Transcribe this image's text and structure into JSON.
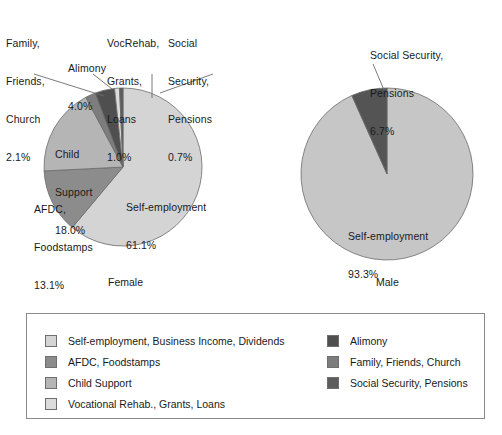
{
  "chart_data": {
    "type": "pie",
    "title": "",
    "charts": [
      {
        "name": "Female",
        "caption": "Female",
        "slices": [
          {
            "label": "Self-employment",
            "value": 61.1,
            "value_text": "61.1%",
            "color": "#d4d4d4",
            "legend_key": "self-employment"
          },
          {
            "label": "AFDC, Foodstamps",
            "value": 13.1,
            "value_text": "13.1%",
            "color": "#8c8c8c",
            "legend_key": "afdc-foodstamps"
          },
          {
            "label": "Child Support",
            "value": 18.0,
            "value_text": "18.0%",
            "color": "#b5b5b5",
            "legend_key": "child-support"
          },
          {
            "label": "Family, Friends, Church",
            "value": 2.1,
            "value_text": "2.1%",
            "color": "#7d7d7d",
            "legend_key": "family-friends-church"
          },
          {
            "label": "Alimony",
            "value": 4.0,
            "value_text": "4.0%",
            "color": "#4f4f4f",
            "legend_key": "alimony"
          },
          {
            "label": "VocRehab, Grants, Loans",
            "value": 1.0,
            "value_text": "1.0%",
            "color": "#dcdcdc",
            "legend_key": "vocational-rehab"
          },
          {
            "label": "Social Security, Pensions",
            "value": 0.7,
            "value_text": "0.7%",
            "color": "#5c5c5c",
            "legend_key": "social-security-pensions"
          }
        ],
        "inside_labels": [
          {
            "name": "self-employment",
            "line1": "Self-employment",
            "line2": "61.1%"
          },
          {
            "name": "child-support",
            "line1": "Child",
            "line2": "Support",
            "line3": "18.0%"
          },
          {
            "name": "afdc-foodstamps",
            "line1": "AFDC,",
            "line2": "Foodstamps",
            "line3": "13.1%"
          }
        ],
        "callout_labels": [
          {
            "name": "family-friends-church",
            "line1": "Family,",
            "line2": "Friends,",
            "line3": "Church",
            "line4": "2.1%"
          },
          {
            "name": "alimony",
            "line1": "Alimony",
            "line2": "4.0%"
          },
          {
            "name": "vocrehab-grants-loans",
            "line1": "VocRehab,",
            "line2": "Grants,",
            "line3": "Loans",
            "line4": "1.0%"
          },
          {
            "name": "social-security-pensions",
            "line1": "Social",
            "line2": "Security,",
            "line3": "Pensions",
            "line4": "0.7%"
          }
        ]
      },
      {
        "name": "Male",
        "caption": "Male",
        "slices": [
          {
            "label": "Self-employment",
            "value": 93.3,
            "value_text": "93.3%",
            "color": "#c6c6c6",
            "legend_key": "self-employment"
          },
          {
            "label": "Social Security, Pensions",
            "value": 6.7,
            "value_text": "6.7%",
            "color": "#545454",
            "legend_key": "social-security-pensions"
          }
        ],
        "inside_labels": [
          {
            "name": "self-employment",
            "line1": "Self-employment",
            "line2": "93.3%"
          }
        ],
        "callout_labels": [
          {
            "name": "social-security-pensions",
            "line1": "Social Security,",
            "line2": "Pensions",
            "line3": "6.7%"
          }
        ]
      }
    ]
  },
  "legend": {
    "left_column": [
      {
        "label": "Self-employment, Business Income, Dividends",
        "color": "#d4d4d4"
      },
      {
        "label": "AFDC, Foodstamps",
        "color": "#8c8c8c"
      },
      {
        "label": "Child Support",
        "color": "#b5b5b5"
      },
      {
        "label": "Vocational Rehab., Grants, Loans",
        "color": "#dcdcdc"
      }
    ],
    "right_column": [
      {
        "label": "Alimony",
        "color": "#4f4f4f"
      },
      {
        "label": "Family, Friends, Church",
        "color": "#7d7d7d"
      },
      {
        "label": "Social Security, Pensions",
        "color": "#5c5c5c"
      }
    ]
  }
}
